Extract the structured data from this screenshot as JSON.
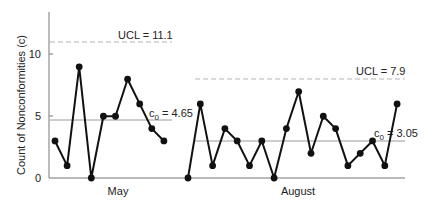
{
  "chart_data": {
    "type": "line",
    "title": "",
    "xlabel": "",
    "ylabel": "Count of Nonconformities (c)",
    "ylim": [
      0,
      13
    ],
    "yticks": [
      0,
      5,
      10
    ],
    "grid": false,
    "legend": null,
    "series": [
      {
        "name": "May",
        "period_label": "May",
        "values": [
          3,
          1,
          9,
          0,
          5,
          5,
          8,
          6,
          4,
          3
        ],
        "center_line": {
          "label": "c0 = 4.65",
          "symbol": "c",
          "subscript": "0",
          "value": 4.65
        },
        "ucl": {
          "label": "UCL = 11.1",
          "value": 11.1
        }
      },
      {
        "name": "August",
        "period_label": "August",
        "values": [
          0,
          6,
          1,
          4,
          3,
          1,
          3,
          0,
          4,
          7,
          2,
          5,
          4,
          1,
          2,
          3,
          1,
          6
        ],
        "center_line": {
          "label": "c0 = 3.05",
          "symbol": "c",
          "subscript": "0",
          "value": 3.05
        },
        "ucl": {
          "label": "UCL = 7.9",
          "value": 7.9
        }
      }
    ],
    "annotations": [
      "UCL = 11.1",
      "c0 = 4.65",
      "UCL = 7.9",
      "c0 = 3.05"
    ]
  },
  "axis": {
    "y_title": "Count of Nonconformities (c)",
    "y_ticks": [
      "0",
      "5",
      "10"
    ],
    "x_labels": [
      "May",
      "August"
    ]
  },
  "labels": {
    "may_ucl": "UCL = 11.1",
    "may_center_symbol": "c",
    "may_center_sub": "0",
    "may_center_value": " = 4.65",
    "aug_ucl": "UCL = 7.9",
    "aug_center_symbol": "c",
    "aug_center_sub": "0",
    "aug_center_value": " = 3.05"
  },
  "colors": {
    "line": "#111111",
    "center_line": "#9a9a9a",
    "ucl": "#b5b5b5",
    "axis": "#777777"
  }
}
